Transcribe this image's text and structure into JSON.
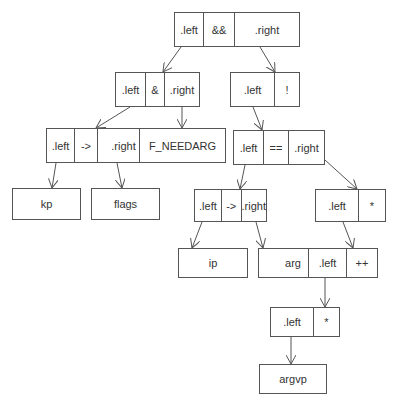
{
  "diagram": {
    "title": "",
    "nodes": {
      "root": {
        "cells": [
          ".left",
          "&&",
          ".right"
        ]
      },
      "and": {
        "cells": [
          ".left",
          "&",
          ".right"
        ]
      },
      "not": {
        "cells": [
          ".left",
          "!"
        ]
      },
      "arrow1": {
        "cells": [
          ".left",
          "->",
          ".right"
        ]
      },
      "fneedarg": {
        "label": "F_NEEDARG"
      },
      "eq": {
        "cells": [
          ".left",
          "==",
          ".right"
        ]
      },
      "kp": {
        "label": "kp"
      },
      "flags": {
        "label": "flags"
      },
      "arrow2": {
        "cells": [
          ".left",
          "->",
          ".right"
        ]
      },
      "deref1": {
        "cells": [
          ".left",
          "*"
        ]
      },
      "ip": {
        "label": "ip"
      },
      "arg": {
        "label": "arg"
      },
      "inc": {
        "cells": [
          ".left",
          "++"
        ]
      },
      "deref2": {
        "cells": [
          ".left",
          "*"
        ]
      },
      "argvp": {
        "label": "argvp"
      }
    },
    "edges": [
      {
        "from": "root.left",
        "to": "and"
      },
      {
        "from": "root.right",
        "to": "not"
      },
      {
        "from": "and.left",
        "to": "arrow1"
      },
      {
        "from": "and.right",
        "to": "fneedarg"
      },
      {
        "from": "not.left",
        "to": "eq"
      },
      {
        "from": "arrow1.left",
        "to": "kp"
      },
      {
        "from": "arrow1.right",
        "to": "flags"
      },
      {
        "from": "eq.left",
        "to": "arrow2"
      },
      {
        "from": "eq.right",
        "to": "deref1"
      },
      {
        "from": "arrow2.left",
        "to": "ip"
      },
      {
        "from": "arrow2.right",
        "to": "arg"
      },
      {
        "from": "deref1.left",
        "to": "inc"
      },
      {
        "from": "inc.left",
        "to": "deref2"
      },
      {
        "from": "deref2.left",
        "to": "argvp"
      }
    ],
    "colors": {
      "stroke": "#555555",
      "text": "#333333",
      "background": "#ffffff"
    }
  }
}
